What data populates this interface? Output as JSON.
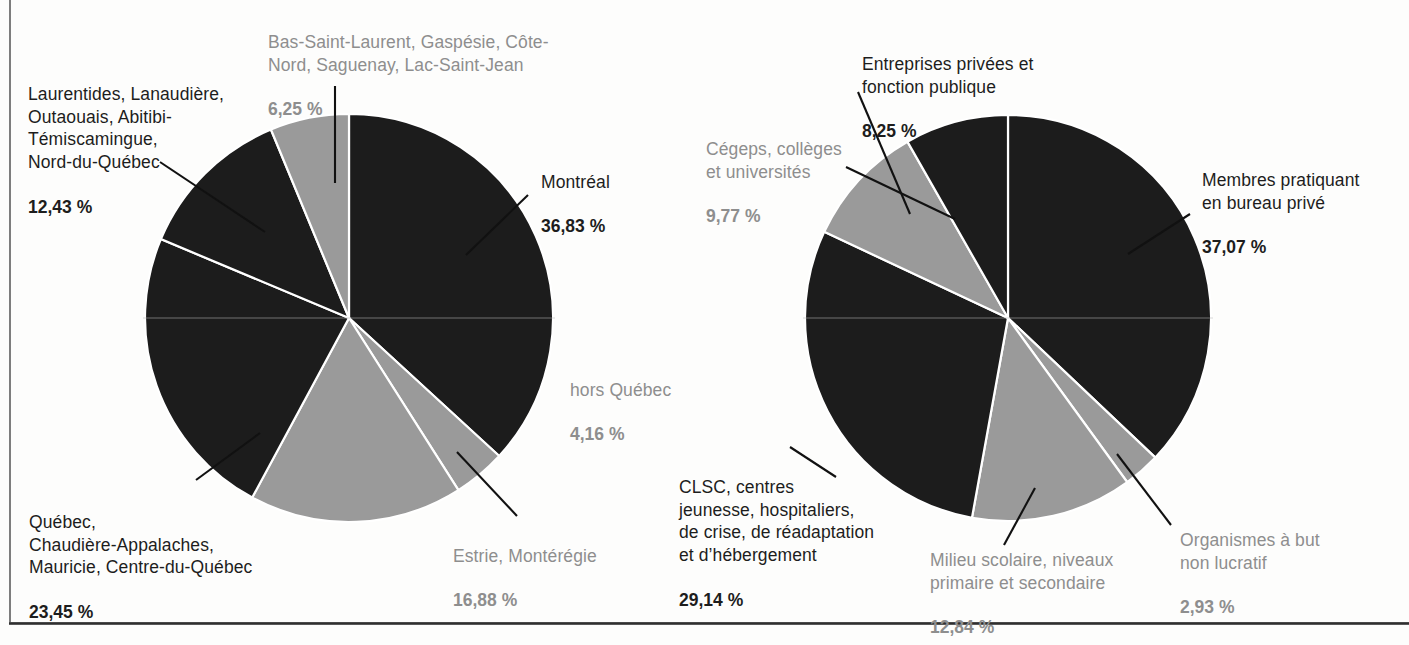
{
  "figure": {
    "background_color": "#fdfdfc",
    "dark_slice_color": "#1c1c1c",
    "light_slice_color": "#9a9a9a",
    "dark_text_color": "#1d1d1d",
    "light_text_color": "#8e8e8e",
    "leader_line_color": "#111111",
    "frame_rule_color": "#565656"
  },
  "chart_data": [
    {
      "type": "pie",
      "id": "repartition-regionale",
      "title": "",
      "start_angle_deg": 0,
      "direction": "clockwise",
      "legend": "labels-with-leader-lines",
      "labels": [
        "Montréal",
        "hors Québec",
        "Estrie, Montérégie",
        "Québec, Chaudière-Appalaches, Mauricie, Centre-du-Québec",
        "Laurentides, Lanaudière, Outaouais, Abitibi-Témiscamingue, Nord-du-Québec",
        "Bas-Saint-Laurent, Gaspésie, Côte-Nord, Saguenay, Lac-Saint-Jean"
      ],
      "values": [
        36.83,
        4.16,
        16.88,
        23.45,
        12.43,
        6.25
      ],
      "value_labels": [
        "36,83 %",
        "4,16 %",
        "16,88 %",
        "23,45 %",
        "12,43 %",
        "6,25 %"
      ],
      "slice_colors": [
        "#1c1c1c",
        "#9a9a9a",
        "#9a9a9a",
        "#1c1c1c",
        "#1c1c1c",
        "#9a9a9a"
      ]
    },
    {
      "type": "pie",
      "id": "repartition-milieu-pratique",
      "title": "",
      "start_angle_deg": 0,
      "direction": "clockwise",
      "legend": "labels-with-leader-lines",
      "labels": [
        "Membres pratiquant en bureau privé",
        "Organismes à but non lucratif",
        "Milieu scolaire, niveaux primaire et secondaire",
        "CLSC, centres jeunesse, hospitaliers, de crise, de réadaptation et d’hébergement",
        "Cégeps, collèges et universités",
        "Entreprises privées et fonction publique"
      ],
      "values": [
        37.07,
        2.93,
        12.84,
        29.14,
        9.77,
        8.25
      ],
      "value_labels": [
        "37,07 %",
        "2,93 %",
        "12,84 %",
        "29,14 %",
        "9,77 %",
        "8,25 %"
      ],
      "slice_colors": [
        "#1c1c1c",
        "#9a9a9a",
        "#9a9a9a",
        "#1c1c1c",
        "#9a9a9a",
        "#1c1c1c"
      ]
    }
  ],
  "left_chart_labels": {
    "bas_saint_laurent": {
      "name": "Bas-Saint-Laurent, Gaspésie, Côte-\nNord, Saguenay, Lac-Saint-Jean",
      "pct": "6,25 %"
    },
    "laurentides": {
      "name": "Laurentides, Lanaudière,\nOutaouais, Abitibi-\nTémiscamingue,\nNord-du-Québec",
      "pct": "12,43 %"
    },
    "montreal": {
      "name": "Montréal",
      "pct": "36,83 %"
    },
    "hors_quebec": {
      "name": "hors Québec",
      "pct": "4,16 %"
    },
    "estrie": {
      "name": "Estrie, Montérégie",
      "pct": "16,88 %"
    },
    "quebec": {
      "name": "Québec,\nChaudière-Appalaches,\nMauricie, Centre-du-Québec",
      "pct": "23,45 %"
    }
  },
  "right_chart_labels": {
    "entreprises": {
      "name": "Entreprises privées et\nfonction publique",
      "pct": "8,25 %"
    },
    "cegeps": {
      "name": "Cégeps, collèges\net universités",
      "pct": "9,77 %"
    },
    "bureau_prive": {
      "name": "Membres pratiquant\nen bureau privé",
      "pct": "37,07 %"
    },
    "organismes": {
      "name": "Organismes à but\nnon lucratif",
      "pct": "2,93 %"
    },
    "milieu_scolaire": {
      "name": "Milieu scolaire, niveaux\nprimaire et secondaire",
      "pct": "12,84 %"
    },
    "clsc": {
      "name": "CLSC, centres\njeunesse, hospitaliers,\nde crise, de réadaptation\net d’hébergement",
      "pct": "29,14 %"
    }
  }
}
